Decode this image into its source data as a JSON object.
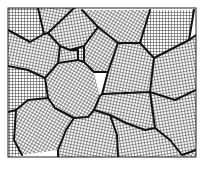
{
  "diagram": {
    "type": "polycrystalline-grain-structure",
    "frame": {
      "x": 8,
      "y": 8,
      "width": 188,
      "height": 149
    },
    "grid_pitch": 3,
    "colors": {
      "background": "#ffffff",
      "grid": "#3a3a3a",
      "boundary": "#111111",
      "frame": "#222222"
    },
    "grains": [
      {
        "id": "g1",
        "points": "8,8 38,8 44,34 30,42 8,30"
      },
      {
        "id": "g2",
        "points": "38,8 74,8 48,33 44,34"
      },
      {
        "id": "g3",
        "points": "74,8 82,10 98,27 84,46 70,50 60,46 48,33"
      },
      {
        "id": "g4",
        "points": "82,10 150,10 140,43 118,43 98,27"
      },
      {
        "id": "g5",
        "points": "150,10 194,10 189,40 154,58 140,43"
      },
      {
        "id": "g6",
        "points": "8,30 30,42 44,34 48,33 60,46 58,63 45,78 28,70 8,66"
      },
      {
        "id": "g7",
        "points": "60,46 70,50 78,50 78,60 58,63"
      },
      {
        "id": "g8",
        "points": "98,27 118,43 108,72 94,72 84,62 84,46"
      },
      {
        "id": "g9",
        "points": "84,46 70,50 78,50 78,60 84,62"
      },
      {
        "id": "g10",
        "points": "118,43 140,43 154,58 150,92 102,94 108,72"
      },
      {
        "id": "g11",
        "points": "189,40 196,35 196,90 175,100 150,92 154,58"
      },
      {
        "id": "g12",
        "points": "58,63 78,60 84,62 94,72 100,96 94,110 88,117 74,118 55,108 48,98 45,78"
      },
      {
        "id": "g13",
        "points": "8,66 28,70 45,78 48,98 28,100 16,110 8,112"
      },
      {
        "id": "g14",
        "points": "102,94 150,92 155,128 145,130 126,123 110,115 94,110 100,96"
      },
      {
        "id": "g15",
        "points": "150,92 175,100 196,90 196,150 182,155 170,140 155,128"
      },
      {
        "id": "g16",
        "points": "16,110 28,100 48,98 55,108 74,118 66,130 58,150 22,155 14,140"
      },
      {
        "id": "g17",
        "points": "8,112 16,110 14,140 22,155 8,157"
      },
      {
        "id": "g18",
        "points": "74,118 88,117 94,110 110,115 117,135 118,157 58,157 58,150 66,130"
      },
      {
        "id": "g19",
        "points": "110,115 126,123 145,130 155,128 170,140 182,155 182,157 118,157 117,135"
      },
      {
        "id": "g20",
        "points": "182,155 196,150 196,157 182,157"
      }
    ],
    "boundaries": [
      "M8,30 L30,42 L44,34 L38,8",
      "M44,34 L48,33 L74,8",
      "M48,33 L60,46 L70,50 L84,46 L98,27 L82,10",
      "M98,27 L118,43 L140,43 L150,10",
      "M140,43 L154,58 L189,40 L194,10",
      "M60,46 L58,63 L45,78 L28,70 L8,66",
      "M70,50 L78,50 L78,60 L58,63",
      "M78,60 L84,62 L84,46",
      "M84,62 L94,72 L108,72 L118,43",
      "M108,72 L102,94 L100,96 L94,110",
      "M154,58 L150,92 L102,94",
      "M150,92 L175,100 L196,90",
      "M45,78 L48,98 L28,100 L16,110 L8,112",
      "M48,98 L55,108 L74,118 L88,117 L94,110",
      "M94,110 L110,115 L126,123 L145,130 L155,128 L150,92",
      "M155,128 L170,140 L182,155 L196,150",
      "M16,110 L14,140 L22,155",
      "M74,118 L66,130 L58,150 L58,157",
      "M110,115 L117,135 L118,157",
      "M189,40 L196,35"
    ]
  }
}
